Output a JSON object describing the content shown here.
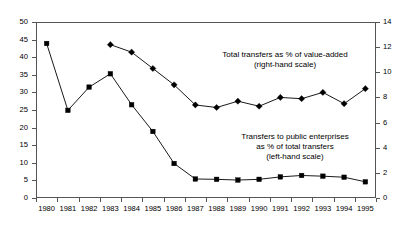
{
  "chart_data": {
    "type": "line",
    "title": "",
    "xlabel": "",
    "ylabel": "",
    "grid": false,
    "legend_position": "inline-annotation",
    "categories": [
      "1980",
      "1981",
      "1982",
      "1983",
      "1984",
      "1985",
      "1986",
      "1987",
      "1988",
      "1989",
      "1990",
      "1991",
      "1992",
      "1993",
      "1994",
      "1995"
    ],
    "x": [
      1980,
      1981,
      1982,
      1983,
      1984,
      1985,
      1986,
      1987,
      1988,
      1989,
      1990,
      1991,
      1992,
      1993,
      1994,
      1995
    ],
    "axes": {
      "left": {
        "label": "Transfers to public enterprises as % of total transfers",
        "ticks": [
          0,
          5,
          10,
          15,
          20,
          25,
          30,
          35,
          40,
          45,
          50
        ],
        "ylim": [
          0,
          50
        ]
      },
      "right": {
        "label": "Total transfers as % of value-added",
        "ticks": [
          0,
          2,
          4,
          6,
          8,
          10,
          12,
          14
        ],
        "ylim": [
          0,
          14
        ]
      }
    },
    "series": [
      {
        "name": "Transfers to public enterprises as % of total transfers (left-hand scale)",
        "axis": "left",
        "marker": "square",
        "color": "#000000",
        "x": [
          1980,
          1981,
          1982,
          1983,
          1984,
          1985,
          1986,
          1987,
          1988,
          1989,
          1990,
          1991,
          1992,
          1993,
          1994,
          1995
        ],
        "values": [
          43.9,
          24.9,
          31.5,
          35.3,
          26.5,
          18.9,
          9.8,
          5.4,
          5.3,
          5.1,
          5.3,
          6.0,
          6.4,
          6.2,
          5.9,
          4.6
        ]
      },
      {
        "name": "Total transfers as % of value-added (right-hand scale)",
        "axis": "right",
        "marker": "diamond",
        "color": "#000000",
        "x": [
          1983,
          1984,
          1985,
          1986,
          1987,
          1988,
          1989,
          1990,
          1991,
          1992,
          1993,
          1994,
          1995
        ],
        "values": [
          12.2,
          11.6,
          10.3,
          9.0,
          7.4,
          7.2,
          7.7,
          7.3,
          8.0,
          7.9,
          8.4,
          7.5,
          8.7
        ]
      }
    ],
    "annotations": [
      {
        "id": "upper-series-annotation",
        "lines": [
          "Total transfers as % of value-added",
          "(right-hand scale)"
        ],
        "line1": "Total transfers as % of value-added",
        "line2": "(right-hand scale)"
      },
      {
        "id": "lower-series-annotation",
        "lines": [
          "Transfers to public enterprises",
          "as % of total transfers",
          "(left-hand scale)"
        ],
        "line1": "Transfers to public enterprises",
        "line2": "as % of total transfers",
        "line3": "(left-hand scale)"
      }
    ],
    "tick_labels": {
      "y_left": [
        "50",
        "45",
        "40",
        "35",
        "30",
        "25",
        "20",
        "15",
        "10",
        "5",
        "0"
      ],
      "y_right": [
        "14",
        "12",
        "10",
        "8",
        "6",
        "4",
        "2",
        "0"
      ],
      "x": [
        "1980",
        "1981",
        "1982",
        "1983",
        "1984",
        "1985",
        "1986",
        "1987",
        "1988",
        "1989",
        "1990",
        "1991",
        "1992",
        "1993",
        "1994",
        "1995"
      ]
    }
  }
}
